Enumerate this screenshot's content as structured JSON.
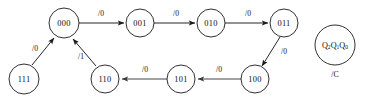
{
  "diagram": {
    "type": "finite-state-machine",
    "stroke_color": "#1a1a1a",
    "edge_color": "#3a3a3a",
    "background": "#ffffff",
    "states": [
      {
        "id": "s000",
        "label": "000",
        "cx": 64,
        "cy": 23,
        "r": 15
      },
      {
        "id": "s001",
        "label": "001",
        "cx": 140,
        "cy": 23,
        "r": 14
      },
      {
        "id": "s010",
        "label": "010",
        "cx": 211,
        "cy": 23,
        "r": 14
      },
      {
        "id": "s011",
        "label": "011",
        "cx": 284,
        "cy": 23,
        "r": 14
      },
      {
        "id": "s100",
        "label": "100",
        "cx": 255,
        "cy": 79,
        "r": 14
      },
      {
        "id": "s101",
        "label": "101",
        "cx": 181,
        "cy": 79,
        "r": 14
      },
      {
        "id": "s110",
        "label": "110",
        "cx": 105,
        "cy": 79,
        "r": 14
      },
      {
        "id": "s111",
        "label": "111",
        "cx": 24,
        "cy": 79,
        "r": 15
      }
    ],
    "transitions": [
      {
        "from": "000",
        "to": "001",
        "label": "/0",
        "lx": 101,
        "ly": 14
      },
      {
        "from": "001",
        "to": "010",
        "label": "/0",
        "lx": 176,
        "ly": 14
      },
      {
        "from": "010",
        "to": "011",
        "label": "/0",
        "lx": 248,
        "ly": 14
      },
      {
        "from": "011",
        "to": "100",
        "label": "/0",
        "lx": 283,
        "ly": 52
      },
      {
        "from": "100",
        "to": "101",
        "label": "/0",
        "lx": 219,
        "ly": 70
      },
      {
        "from": "101",
        "to": "110",
        "label": "/0",
        "lx": 145,
        "ly": 70
      },
      {
        "from": "110",
        "to": "000",
        "label": "/1",
        "lx": 81,
        "ly": 57
      },
      {
        "from": "111",
        "to": "000",
        "label": "/0",
        "lx": 35,
        "ly": 49
      }
    ],
    "legend": {
      "state_encoding": "Q2Q1Q0",
      "state_var_base": "Q",
      "state_var_subscripts": [
        "2",
        "1",
        "0"
      ],
      "output_label": "/C",
      "cx": 335,
      "cy": 45,
      "r": 20
    }
  }
}
